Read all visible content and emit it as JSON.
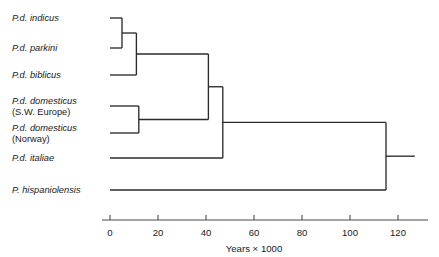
{
  "chart_data": {
    "type": "diagram",
    "subtype": "dendrogram",
    "title": "",
    "xlabel": "Years × 1000",
    "ylabel": "",
    "xlim": [
      0,
      128
    ],
    "grid": false,
    "legend": null,
    "axis": {
      "ticks": [
        0,
        20,
        40,
        60,
        80,
        100,
        120
      ],
      "tick_labels": [
        "0",
        "20",
        "40",
        "60",
        "80",
        "100",
        "120"
      ],
      "title": "Years × 1000",
      "direction": "left-to-right-increasing",
      "units": "thousand years"
    },
    "taxa": [
      {
        "id": "indicus",
        "name": "P.d. indicus",
        "sub": "",
        "tip_time": 0,
        "row": 0
      },
      {
        "id": "parkini",
        "name": "P.d. parkini",
        "sub": "",
        "tip_time": 0,
        "row": 1
      },
      {
        "id": "biblicus",
        "name": "P.d. biblicus",
        "sub": "",
        "tip_time": 0,
        "row": 2
      },
      {
        "id": "domesticus-swe",
        "name": "P.d. domesticus",
        "sub": "(S.W. Europe)",
        "tip_time": 0,
        "row": 3
      },
      {
        "id": "domesticus-nor",
        "name": "P.d. domesticus",
        "sub": "(Norway)",
        "tip_time": 0,
        "row": 4
      },
      {
        "id": "italiae",
        "name": "P.d. italiae",
        "sub": "",
        "tip_time": 0,
        "row": 5
      },
      {
        "id": "hispaniolensis",
        "name": "P. hispaniolensis",
        "sub": "",
        "tip_time": 0,
        "row": 6
      }
    ],
    "nodes": [
      {
        "id": "N1",
        "time": 5,
        "children": [
          "indicus",
          "parkini"
        ]
      },
      {
        "id": "N2",
        "time": 11,
        "children": [
          "N1",
          "biblicus"
        ]
      },
      {
        "id": "N3",
        "time": 12,
        "children": [
          "domesticus-swe",
          "domesticus-nor"
        ]
      },
      {
        "id": "N4",
        "time": 41,
        "children": [
          "N2",
          "N3"
        ]
      },
      {
        "id": "N5",
        "time": 47,
        "children": [
          "N4",
          "italiae"
        ]
      },
      {
        "id": "N6",
        "time": 115,
        "children": [
          "N5",
          "hispaniolensis"
        ]
      }
    ],
    "root": "N6",
    "root_stub_time": 127,
    "colors": {
      "branch": "#2b2b2b",
      "axis": "#4a4a4a",
      "text": "#1a1a1a",
      "background": "#ffffff"
    }
  },
  "geometry": {
    "x_zero_px": 110,
    "px_per_unit": 2.4,
    "row_y_px": [
      18,
      48,
      75,
      106,
      133,
      158,
      190
    ],
    "label_x_px": 12,
    "axis_y_px": 220,
    "tick_len_px": 5,
    "tick_label_y_px": 236,
    "axis_title_y_px": 252
  }
}
